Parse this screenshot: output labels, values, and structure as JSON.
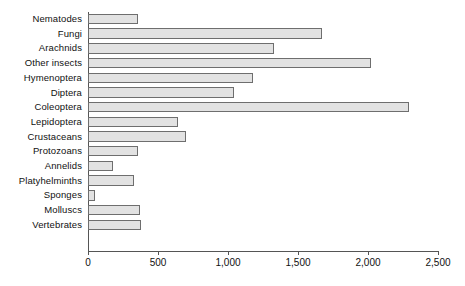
{
  "chart_data": {
    "type": "bar",
    "orientation": "horizontal",
    "title": "",
    "subtitle": "",
    "xlabel": "",
    "ylabel": "",
    "xlim": [
      0,
      2500
    ],
    "xticks": [
      0,
      500,
      1000,
      1500,
      2000,
      2500
    ],
    "xtick_labels": [
      "0",
      "500",
      "1,000",
      "1,500",
      "2,000",
      "2,500"
    ],
    "grid": false,
    "legend": null,
    "bar_color": "#e2e2e2",
    "bar_edge_color": "#6e6e6e",
    "axis_color": "#555555",
    "categories": [
      "Nematodes",
      "Fungi",
      "Arachnids",
      "Other insects",
      "Hymenoptera",
      "Diptera",
      "Coleoptera",
      "Lepidoptera",
      "Crustaceans",
      "Protozoans",
      "Annelids",
      "Platyhelminths",
      "Sponges",
      "Molluscs",
      "Vertebrates"
    ],
    "values": [
      360,
      1670,
      1330,
      2020,
      1180,
      1040,
      2290,
      640,
      700,
      360,
      175,
      330,
      50,
      370,
      380
    ]
  }
}
